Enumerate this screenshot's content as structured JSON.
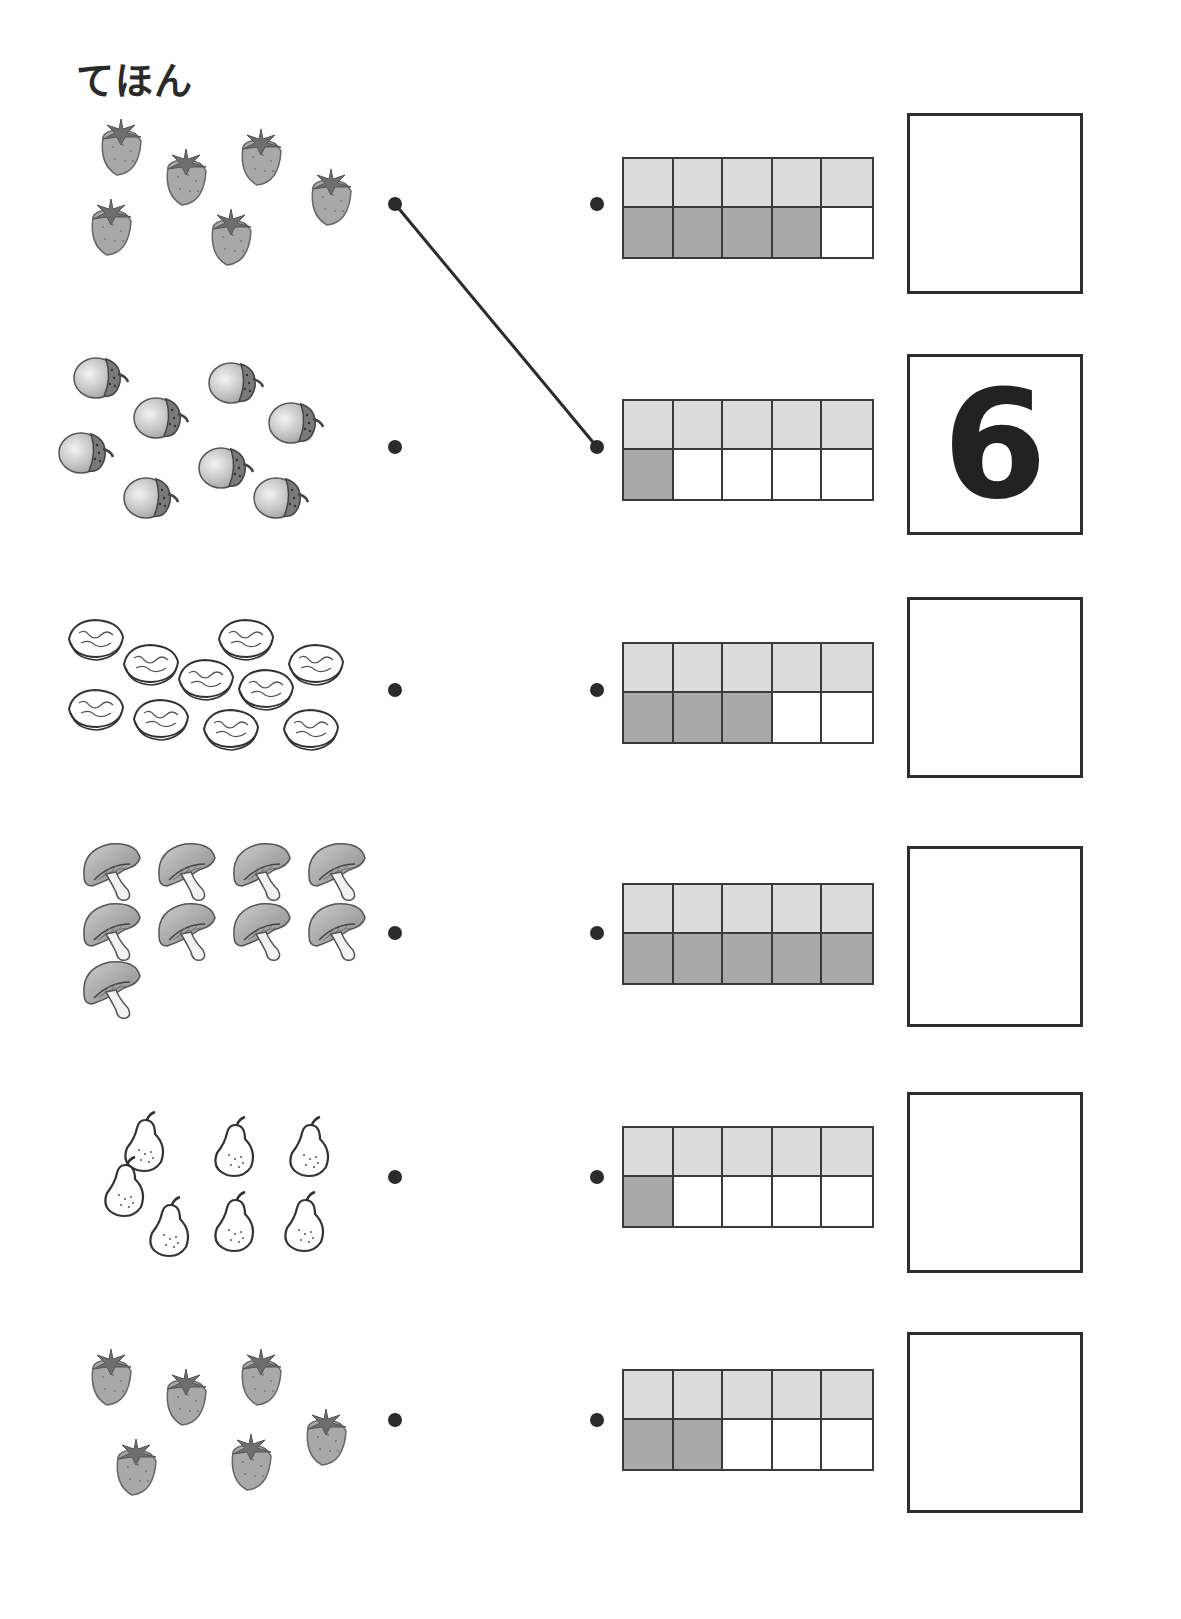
{
  "page": {
    "title": "てほん"
  },
  "colors": {
    "ink": "#2b2b2b",
    "frame_top": "#dcdcdc",
    "frame_filled": "#a9a9a9",
    "frame_empty": "#ffffff"
  },
  "rows": [
    {
      "picture": "strawberry",
      "picture_count": 6,
      "frame_filled": 4,
      "answer": ""
    },
    {
      "picture": "acorn",
      "picture_count": 8,
      "frame_filled": 1,
      "answer": "6"
    },
    {
      "picture": "walnut",
      "picture_count": 10,
      "frame_filled": 3,
      "answer": ""
    },
    {
      "picture": "mushroom",
      "picture_count": 9,
      "frame_filled": 5,
      "answer": ""
    },
    {
      "picture": "pear",
      "picture_count": 7,
      "frame_filled": 1,
      "answer": ""
    },
    {
      "picture": "strawberry",
      "picture_count": 6,
      "frame_filled": 2,
      "answer": ""
    }
  ],
  "example_connection": {
    "from_row": 0,
    "to_row": 1
  }
}
